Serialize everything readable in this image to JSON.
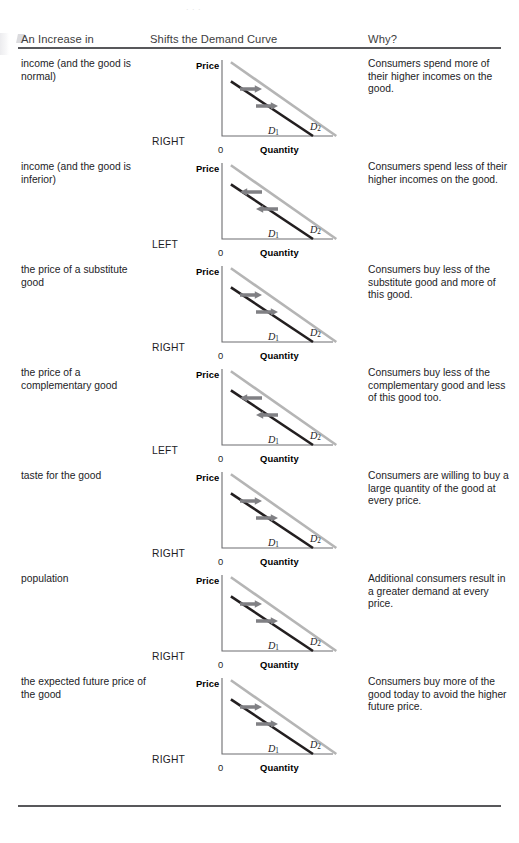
{
  "table": {
    "headers": {
      "cause": "An Increase in",
      "graph": "Shifts the Demand Curve",
      "why": "Why?"
    },
    "graph_labels": {
      "price": "Price",
      "quantity": "Quantity",
      "origin": "0",
      "d1": "D",
      "d1_sub": "1",
      "d2": "D",
      "d2_sub": "2"
    },
    "rows": [
      {
        "cause": "income (and the good is normal)",
        "direction": "RIGHT",
        "arrows": "right",
        "why": "Consumers spend more of their higher incomes on the good."
      },
      {
        "cause": "income (and the good is inferior)",
        "direction": "LEFT",
        "arrows": "left",
        "why": "Consumers spend less of their higher incomes on the good."
      },
      {
        "cause": "the price of a substitute good",
        "direction": "RIGHT",
        "arrows": "right",
        "why": "Consumers buy less of the substitute good and more of this good."
      },
      {
        "cause": "the price of a complementary good",
        "direction": "LEFT",
        "arrows": "left",
        "why": "Consumers buy less of the complementary good and less of this good too."
      },
      {
        "cause": "taste for the good",
        "direction": "RIGHT",
        "arrows": "right",
        "why": "Consumers are willing to buy a large quantity of the good at every price."
      },
      {
        "cause": "population",
        "direction": "RIGHT",
        "arrows": "right",
        "why": "Additional consumers result in a greater demand at every price."
      },
      {
        "cause": "the expected future price of the good",
        "direction": "RIGHT",
        "arrows": "right",
        "why": "Consumers buy more of the good today to avoid the higher future price."
      }
    ]
  },
  "chart_data": {
    "type": "line",
    "title": "Shifts the Demand Curve",
    "xlabel": "Quantity",
    "ylabel": "Price",
    "xlim": [
      0,
      100
    ],
    "ylim": [
      0,
      100
    ],
    "grid": false,
    "legend": "inline-end-labels",
    "series": [
      {
        "name": "D1",
        "x": [
          8,
          82
        ],
        "y": [
          72,
          0
        ],
        "color": "#231f20",
        "width": 2.6
      },
      {
        "name": "D2",
        "x": [
          8,
          103
        ],
        "y": [
          97,
          0
        ],
        "color": "#b5b5b5",
        "width": 2.6
      }
    ],
    "annotations": [
      {
        "text": "arrow between D1 and D2, upper",
        "direction_right": "→",
        "direction_left": "←"
      },
      {
        "text": "arrow between D1 and D2, lower",
        "direction_right": "→",
        "direction_left": "←"
      }
    ],
    "repeats": 7
  },
  "colors": {
    "d1_line": "#231f20",
    "d2_line": "#b5b5b5",
    "axis": "#6d6d70",
    "arrow": "#808084",
    "rule": "#58585b",
    "text": "#1d1d1f",
    "header_text": "#3d3d40",
    "page_background": "#ffffff"
  },
  "artifacts": {
    "top_fragment": ". .  ."
  }
}
